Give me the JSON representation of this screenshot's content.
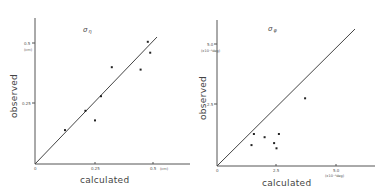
{
  "chart_data": [
    {
      "type": "scatter",
      "title": "σ η",
      "xlabel": "calculated",
      "ylabel": "observed",
      "unit_x": "(cm)",
      "unit_y": "(cm)",
      "xlim": [
        0,
        0.6
      ],
      "ylim": [
        0,
        0.6
      ],
      "x_ticks": [
        "0",
        "0.25",
        "0.5"
      ],
      "y_ticks": [
        "0.25",
        "0.5"
      ],
      "grid": false,
      "reference_line": "y = x",
      "points": [
        {
          "x": 0.125,
          "y": 0.14
        },
        {
          "x": 0.21,
          "y": 0.22
        },
        {
          "x": 0.25,
          "y": 0.18
        },
        {
          "x": 0.275,
          "y": 0.28
        },
        {
          "x": 0.32,
          "y": 0.4
        },
        {
          "x": 0.44,
          "y": 0.39
        },
        {
          "x": 0.47,
          "y": 0.505
        },
        {
          "x": 0.48,
          "y": 0.46
        }
      ]
    },
    {
      "type": "scatter",
      "title": "σ φ",
      "xlabel": "calculated",
      "ylabel": "observed",
      "unit_x": "(x10⁻³deg)",
      "unit_y": "(x10⁻³deg)",
      "xlim": [
        0,
        6.0
      ],
      "ylim": [
        0,
        6.0
      ],
      "x_ticks": [
        "0",
        "2.5",
        "5.0"
      ],
      "y_ticks": [
        "2.5",
        "5.0"
      ],
      "grid": false,
      "reference_line": "y = x",
      "points": [
        {
          "x": 1.45,
          "y": 0.85
        },
        {
          "x": 1.55,
          "y": 1.3
        },
        {
          "x": 2.0,
          "y": 1.17
        },
        {
          "x": 2.4,
          "y": 0.93
        },
        {
          "x": 2.5,
          "y": 0.72
        },
        {
          "x": 2.6,
          "y": 1.3
        },
        {
          "x": 3.7,
          "y": 2.75
        }
      ]
    }
  ],
  "charts": {
    "left": {
      "title_symbol": "σ",
      "title_subscript": "η",
      "xlabel": "calculated",
      "ylabel": "observed",
      "origin": "0",
      "x_tick_1": "0.25",
      "x_tick_2": "0.5",
      "x_unit": "(cm)",
      "y_tick_1": "0.25",
      "y_tick_2": "0.5",
      "y_unit": "(cm)"
    },
    "right": {
      "title_symbol": "σ",
      "title_subscript": "φ",
      "xlabel": "calculated",
      "ylabel": "observed",
      "origin": "0",
      "x_tick_1": "2.5",
      "x_tick_2": "5.0",
      "x_unit": "(x10⁻³deg)",
      "y_tick_1": "2.5",
      "y_tick_2": "5.0",
      "y_unit": "(x10⁻³deg)"
    }
  }
}
